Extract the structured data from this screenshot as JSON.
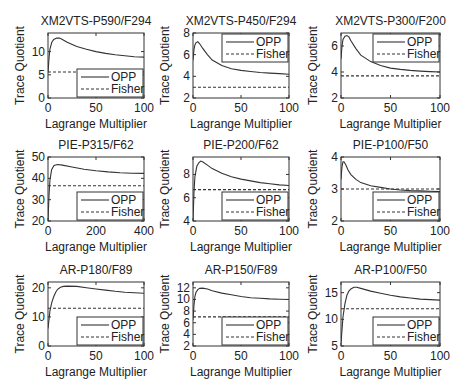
{
  "figure": {
    "width": 466,
    "height": 390,
    "background": "#ffffff",
    "line_color": "#333333"
  },
  "chart_data": [
    {
      "type": "line",
      "title": "XM2VTS-P590/F294",
      "xlabel": "Lagrange Multiplier",
      "ylabel": "Trace Quotient",
      "xlim": [
        0,
        100
      ],
      "ylim": [
        0,
        14
      ],
      "xticks": [
        0,
        50,
        100
      ],
      "yticks": [
        0,
        5,
        10
      ],
      "legend_position": "lower right",
      "series": [
        {
          "name": "OPP",
          "style": "solid",
          "x": [
            0,
            1,
            2,
            4,
            6,
            9,
            12,
            15,
            20,
            30,
            40,
            50,
            60,
            70,
            80,
            90,
            100
          ],
          "y": [
            5.5,
            8.5,
            10.5,
            12.0,
            12.6,
            12.9,
            12.9,
            12.6,
            12.0,
            11.1,
            10.5,
            10.0,
            9.6,
            9.3,
            9.1,
            8.9,
            8.8
          ]
        },
        {
          "name": "Fisher",
          "style": "dashed",
          "x": [
            0,
            100
          ],
          "y": [
            5.6,
            5.6
          ]
        }
      ]
    },
    {
      "type": "line",
      "title": "XM2VTS-P450/F294",
      "xlabel": "Lagrange Multiplier",
      "ylabel": "Trace Quotient",
      "xlim": [
        0,
        100
      ],
      "ylim": [
        2,
        8
      ],
      "xticks": [
        0,
        50,
        100
      ],
      "yticks": [
        2,
        4,
        6,
        8
      ],
      "legend_position": "upper right",
      "series": [
        {
          "name": "OPP",
          "style": "solid",
          "x": [
            0,
            1,
            2,
            3,
            5,
            7,
            10,
            15,
            20,
            30,
            40,
            50,
            60,
            70,
            80,
            90,
            100
          ],
          "y": [
            5.5,
            6.5,
            6.9,
            7.1,
            7.2,
            7.0,
            6.6,
            6.0,
            5.5,
            5.0,
            4.7,
            4.55,
            4.45,
            4.35,
            4.3,
            4.25,
            4.2
          ]
        },
        {
          "name": "Fisher",
          "style": "dashed",
          "x": [
            0,
            100
          ],
          "y": [
            3.0,
            3.0
          ]
        }
      ]
    },
    {
      "type": "line",
      "title": "XM2VTS-P300/F200",
      "xlabel": "Lagrange Multiplier",
      "ylabel": "Trace Quotient",
      "xlim": [
        0,
        100
      ],
      "ylim": [
        2,
        7
      ],
      "xticks": [
        0,
        50,
        100
      ],
      "yticks": [
        2,
        4,
        6
      ],
      "legend_position": "upper right",
      "series": [
        {
          "name": "OPP",
          "style": "solid",
          "x": [
            0,
            1,
            2,
            4,
            6,
            8,
            10,
            15,
            20,
            30,
            40,
            50,
            60,
            70,
            80,
            90,
            100
          ],
          "y": [
            5.0,
            6.0,
            6.5,
            6.75,
            6.8,
            6.7,
            6.4,
            5.8,
            5.3,
            4.8,
            4.5,
            4.3,
            4.2,
            4.12,
            4.07,
            4.03,
            4.0
          ]
        },
        {
          "name": "Fisher",
          "style": "dashed",
          "x": [
            0,
            100
          ],
          "y": [
            3.7,
            3.7
          ]
        }
      ]
    },
    {
      "type": "line",
      "title": "PIE-P315/F62",
      "xlabel": "Lagrange Multiplier",
      "ylabel": "Trace Quotient",
      "xlim": [
        0,
        400
      ],
      "ylim": [
        20,
        50
      ],
      "xticks": [
        0,
        200,
        400
      ],
      "yticks": [
        20,
        30,
        40,
        50
      ],
      "legend_position": "lower right",
      "series": [
        {
          "name": "OPP",
          "style": "solid",
          "x": [
            0,
            4,
            8,
            15,
            25,
            40,
            60,
            100,
            150,
            200,
            250,
            300,
            350,
            400
          ],
          "y": [
            20,
            32,
            39,
            44,
            46,
            46.5,
            46.2,
            45.3,
            44.3,
            43.6,
            43.0,
            42.6,
            42.4,
            42.3
          ]
        },
        {
          "name": "Fisher",
          "style": "dashed",
          "x": [
            0,
            400
          ],
          "y": [
            36.5,
            36.5
          ]
        }
      ]
    },
    {
      "type": "line",
      "title": "PIE-P200/F62",
      "xlabel": "Lagrange Multiplier",
      "ylabel": "Trace Quotient",
      "xlim": [
        0,
        100
      ],
      "ylim": [
        4,
        9.5
      ],
      "xticks": [
        0,
        50,
        100
      ],
      "yticks": [
        4,
        6,
        8
      ],
      "legend_position": "lower right",
      "series": [
        {
          "name": "OPP",
          "style": "solid",
          "x": [
            0,
            1,
            2,
            4,
            6,
            8,
            10,
            15,
            20,
            30,
            40,
            50,
            60,
            70,
            80,
            90,
            100
          ],
          "y": [
            4.0,
            6.5,
            7.8,
            8.7,
            9.0,
            9.15,
            9.1,
            8.8,
            8.5,
            8.1,
            7.8,
            7.6,
            7.45,
            7.3,
            7.2,
            7.1,
            7.05
          ]
        },
        {
          "name": "Fisher",
          "style": "dashed",
          "x": [
            0,
            100
          ],
          "y": [
            6.7,
            6.7
          ]
        }
      ]
    },
    {
      "type": "line",
      "title": "PIE-P100/F50",
      "xlabel": "Lagrange Multiplier",
      "ylabel": "Trace Quotient",
      "xlim": [
        0,
        100
      ],
      "ylim": [
        2,
        4
      ],
      "xticks": [
        0,
        50,
        100
      ],
      "yticks": [
        2,
        3,
        4
      ],
      "legend_position": "lower right",
      "series": [
        {
          "name": "OPP",
          "style": "solid",
          "x": [
            0,
            1,
            2,
            3,
            5,
            7,
            10,
            15,
            20,
            30,
            40,
            50,
            60,
            70,
            80,
            90,
            100
          ],
          "y": [
            3.3,
            3.7,
            3.85,
            3.85,
            3.75,
            3.6,
            3.45,
            3.3,
            3.2,
            3.1,
            3.05,
            3.0,
            2.97,
            2.95,
            2.94,
            2.93,
            2.92
          ]
        },
        {
          "name": "Fisher",
          "style": "dashed",
          "x": [
            0,
            100
          ],
          "y": [
            3.0,
            3.0
          ]
        }
      ]
    },
    {
      "type": "line",
      "title": "AR-P180/F89",
      "xlabel": "Lagrange Multiplier",
      "ylabel": "Trace Quotient",
      "xlim": [
        0,
        100
      ],
      "ylim": [
        0,
        22
      ],
      "xticks": [
        0,
        50,
        100
      ],
      "yticks": [
        0,
        10,
        20
      ],
      "legend_position": "lower right",
      "series": [
        {
          "name": "OPP",
          "style": "solid",
          "x": [
            0,
            1,
            2,
            4,
            6,
            8,
            10,
            13,
            16,
            20,
            30,
            40,
            50,
            60,
            70,
            80,
            90,
            100
          ],
          "y": [
            6,
            9,
            12,
            15,
            17,
            18.5,
            19.5,
            20.2,
            20.5,
            20.6,
            20.5,
            20.0,
            19.6,
            19.2,
            18.8,
            18.5,
            18.3,
            18.1
          ]
        },
        {
          "name": "Fisher",
          "style": "dashed",
          "x": [
            0,
            100
          ],
          "y": [
            13,
            13
          ]
        }
      ]
    },
    {
      "type": "line",
      "title": "AR-P150/F89",
      "xlabel": "Lagrange Multiplier",
      "ylabel": "Trace Quotient",
      "xlim": [
        0,
        100
      ],
      "ylim": [
        2,
        13
      ],
      "xticks": [
        0,
        50,
        100
      ],
      "yticks": [
        2,
        4,
        6,
        8,
        10,
        12
      ],
      "legend_position": "lower right",
      "series": [
        {
          "name": "OPP",
          "style": "solid",
          "x": [
            0,
            1,
            2,
            3,
            5,
            7,
            10,
            15,
            20,
            30,
            40,
            50,
            60,
            70,
            80,
            90,
            100
          ],
          "y": [
            6.5,
            9.0,
            10.5,
            11.2,
            11.7,
            11.9,
            11.95,
            11.8,
            11.5,
            11.1,
            10.8,
            10.5,
            10.3,
            10.2,
            10.1,
            10.05,
            10.0
          ]
        },
        {
          "name": "Fisher",
          "style": "dashed",
          "x": [
            0,
            100
          ],
          "y": [
            7.0,
            7.0
          ]
        }
      ]
    },
    {
      "type": "line",
      "title": "AR-P100/F50",
      "xlabel": "Lagrange Multiplier",
      "ylabel": "Trace Quotient",
      "xlim": [
        0,
        100
      ],
      "ylim": [
        5,
        17
      ],
      "xticks": [
        0,
        50,
        100
      ],
      "yticks": [
        5,
        10,
        15
      ],
      "legend_position": "lower right",
      "series": [
        {
          "name": "OPP",
          "style": "solid",
          "x": [
            0,
            1,
            2,
            4,
            6,
            8,
            10,
            13,
            16,
            20,
            30,
            40,
            50,
            60,
            70,
            80,
            90,
            100
          ],
          "y": [
            5.5,
            8,
            10.5,
            13,
            14.5,
            15.3,
            15.7,
            16.0,
            16.0,
            15.8,
            15.3,
            14.9,
            14.5,
            14.2,
            14.0,
            13.8,
            13.7,
            13.6
          ]
        },
        {
          "name": "Fisher",
          "style": "dashed",
          "x": [
            0,
            100
          ],
          "y": [
            12,
            12
          ]
        }
      ]
    }
  ]
}
